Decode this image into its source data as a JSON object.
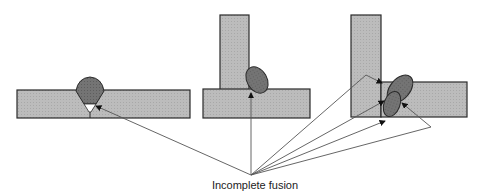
{
  "diagram": {
    "caption": "Incomplete fusion",
    "joints": [
      {
        "type": "butt-joint",
        "defect_locations": 1
      },
      {
        "type": "tee-joint",
        "defect_locations": 1
      },
      {
        "type": "corner-joint",
        "defect_locations": 4
      }
    ],
    "colors": {
      "plate_fill": "#b8b8b8",
      "weld_fill": "#6e6e6e",
      "outline": "#2a2a2a",
      "leader_line": "#555555"
    }
  }
}
